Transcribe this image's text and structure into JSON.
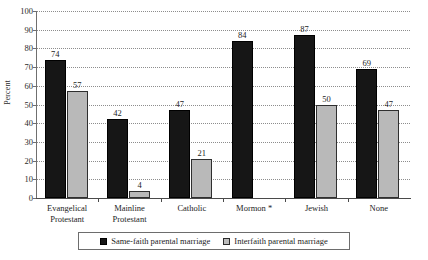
{
  "chart_data": {
    "type": "bar",
    "title": "",
    "xlabel": "",
    "ylabel": "Percent",
    "ylim": [
      0,
      100
    ],
    "ytick_step": 10,
    "yticks": [
      0,
      10,
      20,
      30,
      40,
      50,
      60,
      70,
      80,
      90,
      100
    ],
    "grid": true,
    "legend_position": "bottom",
    "categories": [
      "Evangelical Protestant",
      "Mainline Protestant",
      "Catholic",
      "Mormon *",
      "Jewish",
      "None"
    ],
    "category_lines": [
      [
        "Evangelical",
        "Protestant"
      ],
      [
        "Mainline",
        "Protestant"
      ],
      [
        "Catholic"
      ],
      [
        "Mormon *"
      ],
      [
        "Jewish"
      ],
      [
        "None"
      ]
    ],
    "series": [
      {
        "name": "Same-faith parental marriage",
        "color": "#161616",
        "values": [
          74,
          42,
          47,
          84,
          87,
          69
        ]
      },
      {
        "name": "Interfaith parental marriage",
        "color": "#b9b9b9",
        "values": [
          57,
          4,
          21,
          null,
          50,
          47
        ]
      }
    ]
  },
  "legend": {
    "items": [
      {
        "label": "Same-faith parental marriage",
        "swatch": "dark"
      },
      {
        "label": "Interfaith parental marriage",
        "swatch": "light"
      }
    ]
  },
  "axis": {
    "y_title": "Percent"
  }
}
